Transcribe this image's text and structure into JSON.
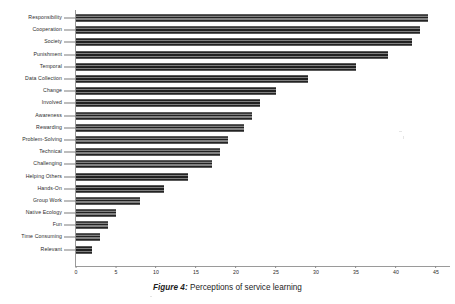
{
  "figure": {
    "caption_prefix": "Figure 4:",
    "caption_text": "Perceptions of service learning"
  },
  "chart_data": {
    "type": "bar",
    "orientation": "horizontal",
    "title": "Perceptions of service learning",
    "xlabel": "",
    "ylabel": "",
    "xlim": [
      0,
      45
    ],
    "grid": false,
    "legend": null,
    "xticks": [
      0,
      5,
      10,
      15,
      20,
      25,
      30,
      35,
      40,
      45
    ],
    "xtick_labels": [
      "0",
      "5",
      "10",
      "15",
      "20",
      "25",
      "30",
      "35",
      "40",
      "45"
    ],
    "categories": [
      "Responsibility",
      "Cooperation",
      "Society",
      "Punishment",
      "Temporal",
      "Data Collection",
      "Change",
      "Involved",
      "Awareness",
      "Rewarding",
      "Problem-Solving",
      "Technical",
      "Challenging",
      "Helping Others",
      "Hands-On",
      "Group Work",
      "Native Ecology",
      "Fun",
      "Time Consuming",
      "Relevant"
    ],
    "values": [
      44,
      43,
      42,
      39,
      35,
      29,
      25,
      23,
      22,
      21,
      19,
      18,
      17,
      14,
      11,
      8,
      5,
      4,
      3,
      2
    ],
    "bar_color": "#4a4a4a",
    "axis_color": "#9a9a9a"
  }
}
